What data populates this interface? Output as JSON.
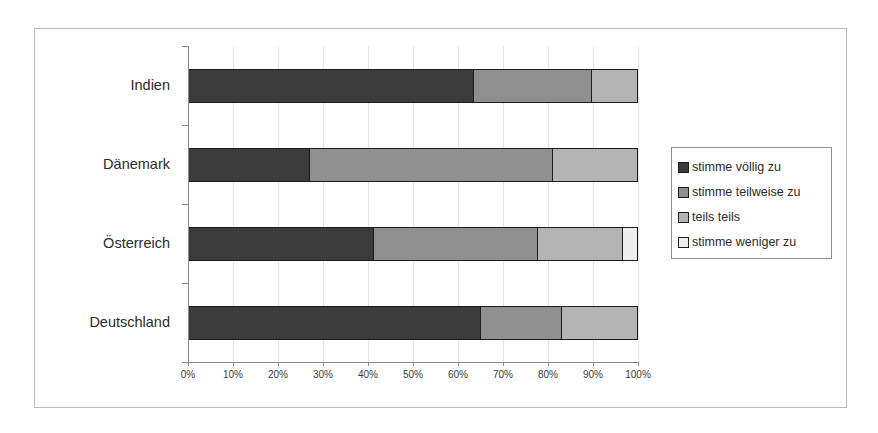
{
  "chart_data": {
    "type": "bar",
    "orientation": "horizontal",
    "stacked": true,
    "normalized": "100%",
    "title": "",
    "subtitle": "",
    "xlabel": "",
    "ylabel": "",
    "xlim": [
      0,
      100
    ],
    "grid": true,
    "legend_position": "right",
    "categories": [
      "Indien",
      "Dänemark",
      "Österreich",
      "Deutschland"
    ],
    "xticklabels": [
      "0%",
      "10%",
      "20%",
      "30%",
      "40%",
      "50%",
      "60%",
      "70%",
      "80%",
      "90%",
      "100%"
    ],
    "xtickvalues": [
      0,
      10,
      20,
      30,
      40,
      50,
      60,
      70,
      80,
      90,
      100
    ],
    "series": [
      {
        "name": "stimme völlig zu",
        "color": "#3b3b3b",
        "values": [
          63.3,
          26.7,
          41.0,
          65.0
        ]
      },
      {
        "name": "stimme teilweise zu",
        "color": "#8f8f8f",
        "values": [
          26.4,
          54.4,
          36.7,
          18.0
        ]
      },
      {
        "name": "teils teils",
        "color": "#b4b4b4",
        "values": [
          10.3,
          18.9,
          19.0,
          17.0
        ]
      },
      {
        "name": "stimme weniger zu",
        "color": "#ededed",
        "values": [
          0.0,
          0.0,
          3.3,
          0.0
        ]
      }
    ]
  },
  "legend": {
    "entries": [
      {
        "label": "stimme völlig zu"
      },
      {
        "label": "stimme teilweise zu"
      },
      {
        "label": "teils teils"
      },
      {
        "label": "stimme weniger zu"
      }
    ]
  }
}
